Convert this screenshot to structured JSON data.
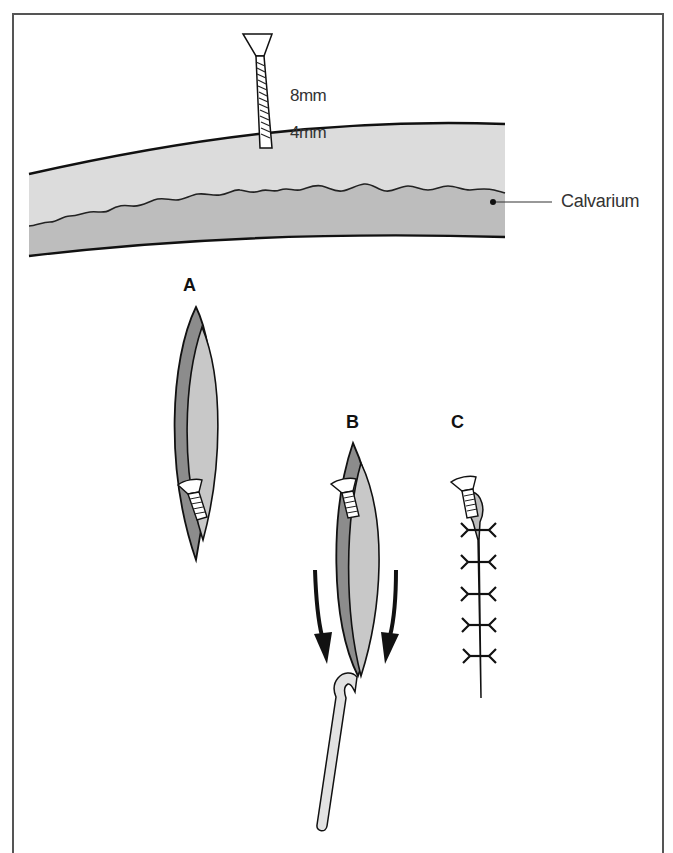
{
  "figure": {
    "labels": {
      "screw_length": "8mm",
      "bone_depth": "4mm",
      "calvarium": "Calvarium",
      "step_a": "A",
      "step_b": "B",
      "step_c": "C"
    },
    "colors": {
      "frame": "#555555",
      "outer_table": "#dcdcdc",
      "inner_bone": "#bdbdbd",
      "flap_dark": "#8c8c8c",
      "flap_light": "#c8c8c8",
      "outline": "#111111",
      "screw_fill": "#ffffff",
      "needle_fill": "#e2e2e2"
    },
    "icons": {
      "screw": "screw-icon",
      "arrow": "down-arrow-icon",
      "needle": "hook-needle-icon",
      "stitch": "suture-stitch-icon"
    },
    "stitch_count": 5
  }
}
